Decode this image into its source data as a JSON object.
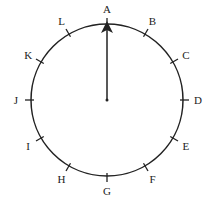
{
  "diagram": {
    "type": "dial",
    "center": [
      107,
      100
    ],
    "radius": 76,
    "pointer_target": "A",
    "positions": [
      {
        "label": "A",
        "angle": 0
      },
      {
        "label": "B",
        "angle": 30
      },
      {
        "label": "C",
        "angle": 60
      },
      {
        "label": "D",
        "angle": 90
      },
      {
        "label": "E",
        "angle": 120
      },
      {
        "label": "F",
        "angle": 150
      },
      {
        "label": "G",
        "angle": 180
      },
      {
        "label": "H",
        "angle": 210
      },
      {
        "label": "I",
        "angle": 240
      },
      {
        "label": "J",
        "angle": 270
      },
      {
        "label": "K",
        "angle": 300
      },
      {
        "label": "L",
        "angle": 330
      }
    ],
    "colors": {
      "stroke": "#222222",
      "background": "#ffffff"
    }
  }
}
